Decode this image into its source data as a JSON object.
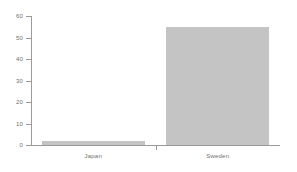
{
  "chart_data": {
    "type": "bar",
    "title": "",
    "subtitle": "",
    "xlabel": "",
    "ylabel": "",
    "categories": [
      "Japan",
      "Sweden"
    ],
    "values": [
      2,
      55
    ],
    "ylim": [
      0,
      60
    ],
    "yticks": [
      0,
      10,
      20,
      30,
      40,
      50,
      60
    ],
    "ytick_labels": [
      "0",
      "10",
      "20",
      "30",
      "40",
      "50",
      "60"
    ],
    "grid": false,
    "legend": false,
    "legend_position": "none",
    "bar_color": "#c4c4c4",
    "axis_color": "#9a9a9a",
    "text_color": "#6f6f6f",
    "background_color": "#ffffff"
  }
}
